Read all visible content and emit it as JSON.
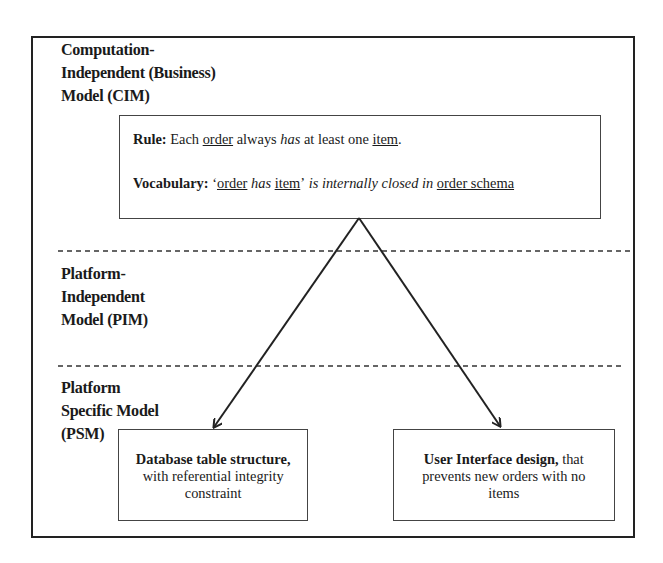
{
  "diagram": {
    "layers": {
      "cim": {
        "label_lines": [
          "Computation-",
          "Independent (Business)",
          "Model (CIM)"
        ]
      },
      "pim": {
        "label_lines": [
          "Platform-",
          "Independent",
          "Model (PIM)"
        ]
      },
      "psm": {
        "label_lines": [
          "Platform",
          "Specific Model",
          "(PSM)"
        ]
      }
    },
    "cim_box": {
      "rule": {
        "label": "Rule:",
        "t1": " Each ",
        "order": "order",
        "t2": " always ",
        "has": "has",
        "t3": " at  least one ",
        "item": "item",
        "t4": "."
      },
      "vocabulary": {
        "label": "Vocabulary:",
        "q_open": " ‘",
        "order": "order",
        "sp1": " ",
        "has": "has",
        "sp2": " ",
        "item": "item",
        "q_close": "’",
        "closed_text": " is internally closed in ",
        "schema": "order schema"
      }
    },
    "psm_boxes": {
      "database": {
        "title": "Database table structure,",
        "line2": "with referential integrity",
        "line3": "constraint"
      },
      "ui": {
        "title": "User Interface design,",
        "title_rest": " that",
        "line2": "prevents new orders with no",
        "line3": "items"
      }
    },
    "connectors": {
      "source": "cim_box",
      "targets": [
        "database",
        "ui"
      ],
      "style": "arrow"
    },
    "separators": [
      "dashed-line-cim-pim",
      "dashed-line-pim-psm"
    ],
    "colors": {
      "stroke": "#222222",
      "background": "#ffffff",
      "text": "#1a1a1a"
    }
  }
}
